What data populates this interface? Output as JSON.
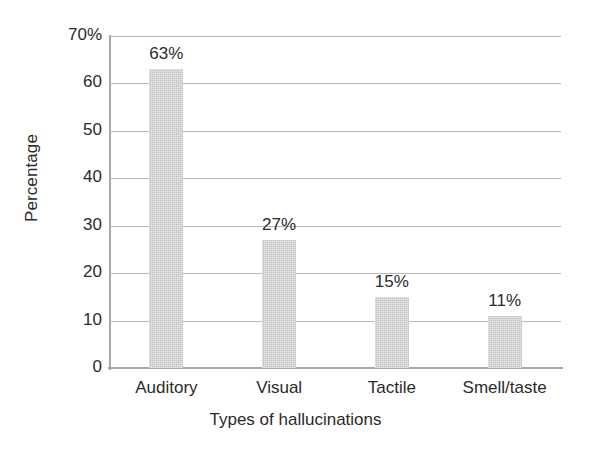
{
  "chart_data": {
    "type": "bar",
    "title": "",
    "subtitle": "",
    "categories": [
      "Auditory",
      "Visual",
      "Tactile",
      "Smell/taste"
    ],
    "values": [
      63,
      27,
      15,
      11
    ],
    "data_labels": [
      "63%",
      "27%",
      "15%",
      "11%"
    ],
    "xlabel": "Types of hallucinations",
    "ylabel": "Percentage",
    "ylim": [
      0,
      70
    ],
    "ytick_values": [
      70,
      60,
      50,
      40,
      30,
      20,
      10,
      0
    ],
    "ytick_labels": [
      "70%",
      "60",
      "50",
      "40",
      "30",
      "20",
      "10",
      "0"
    ],
    "grid": true,
    "grid_axis": "y",
    "legend": false,
    "legend_position": "none",
    "bar_color": "#c6c6c6",
    "grid_color": "#b9b9b9",
    "axis_color": "#a8a8a8",
    "text_color": "#2b2b2b",
    "background_color": "#ffffff"
  }
}
